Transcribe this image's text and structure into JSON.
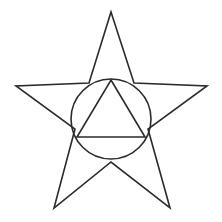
{
  "figure": {
    "canvas": {
      "width": 222,
      "height": 222,
      "background_color": "#ffffff"
    },
    "style": {
      "stroke_color": "#2b2b2b",
      "stroke_width": 1.6,
      "fill": "none"
    },
    "shapes": [
      {
        "name": "star",
        "type": "polygon",
        "sides": 5,
        "outline_points": "111,12 134,83 207,86 148,129 170,208 111,162 54,208 75,129 16,86 89,83",
        "outer_points": [
          {
            "label": "top",
            "x": 111,
            "y": 12
          },
          {
            "label": "right",
            "x": 207,
            "y": 86
          },
          {
            "label": "bottom-right",
            "x": 170,
            "y": 208
          },
          {
            "label": "bottom-left",
            "x": 54,
            "y": 208
          },
          {
            "label": "left",
            "x": 16,
            "y": 86
          }
        ],
        "inner_points": [
          {
            "label": "upper-right-notch",
            "x": 134,
            "y": 83
          },
          {
            "label": "lower-right-notch",
            "x": 148,
            "y": 129
          },
          {
            "label": "bottom-notch",
            "x": 111,
            "y": 162
          },
          {
            "label": "lower-left-notch",
            "x": 75,
            "y": 129
          },
          {
            "label": "upper-left-notch",
            "x": 89,
            "y": 83
          }
        ]
      },
      {
        "name": "circle",
        "type": "circle",
        "center_x": 111,
        "center_y": 119,
        "radius": 40
      },
      {
        "name": "triangle",
        "type": "polygon",
        "sides": 3,
        "outline_points": "111,80 145,137 77,137",
        "vertices": [
          {
            "label": "apex",
            "x": 111,
            "y": 80
          },
          {
            "label": "base-right",
            "x": 145,
            "y": 137
          },
          {
            "label": "base-left",
            "x": 77,
            "y": 137
          }
        ]
      }
    ]
  }
}
